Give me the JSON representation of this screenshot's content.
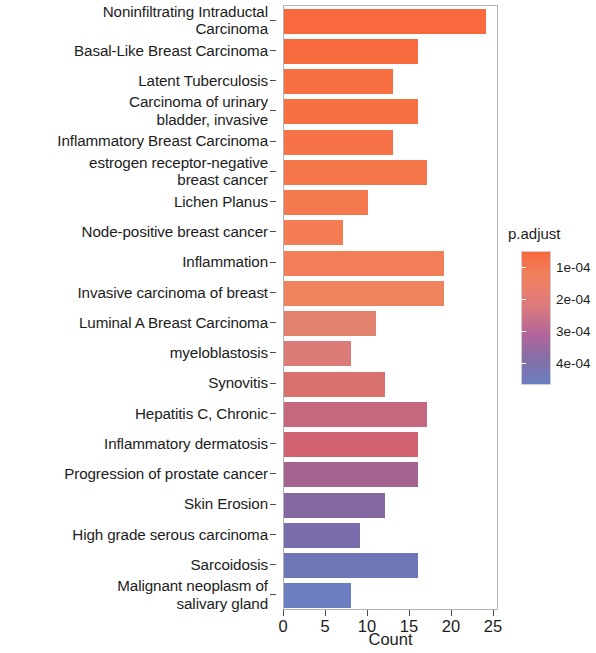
{
  "chart_data": {
    "type": "bar",
    "orientation": "horizontal",
    "title": "",
    "xlabel": "Count",
    "ylabel": "",
    "xlim": [
      0,
      25
    ],
    "xticks": [
      0,
      5,
      10,
      15,
      20,
      25
    ],
    "xtick_labels": [
      "0",
      "5",
      "10",
      "15",
      "20",
      "25"
    ],
    "grid": false,
    "legend": {
      "title": "p.adjust",
      "position": "right",
      "type": "continuous-colorbar",
      "ticks": [
        0.0001,
        0.0002,
        0.0003,
        0.0004
      ],
      "tick_labels": [
        "1e-04",
        "2e-04",
        "3e-04",
        "4e-04"
      ],
      "range": [
        5e-05,
        0.00047
      ],
      "low_color": "#F8693D",
      "high_color": "#6B7FC0"
    },
    "categories": [
      "Noninfiltrating Intraductal\nCarcinoma",
      "Basal-Like Breast Carcinoma",
      "Latent Tuberculosis",
      "Carcinoma of urinary\nbladder, invasive",
      "Inflammatory Breast Carcinoma",
      "estrogen receptor-negative\nbreast cancer",
      "Lichen Planus",
      "Node-positive breast cancer",
      "Inflammation",
      "Invasive carcinoma of breast",
      "Luminal A Breast Carcinoma",
      "myeloblastosis",
      "Synovitis",
      "Hepatitis C, Chronic",
      "Inflammatory dermatosis",
      "Progression of prostate cancer",
      "Skin Erosion",
      "High grade serous carcinoma",
      "Sarcoidosis",
      "Malignant neoplasm of\nsalivary gland"
    ],
    "values": [
      24,
      16,
      13,
      16,
      13,
      17,
      10,
      7,
      19,
      19,
      11,
      8,
      12,
      17,
      16,
      16,
      12,
      9,
      16,
      8
    ],
    "p_adjust": [
      5.5e-05,
      6e-05,
      6.5e-05,
      7e-05,
      8e-05,
      9e-05,
      0.0001,
      0.000105,
      0.000115,
      0.000125,
      0.00015,
      0.00017,
      0.00018,
      0.00023,
      0.00025,
      0.0003,
      0.00034,
      0.000375,
      0.0004,
      0.00044
    ],
    "bar_colors": [
      "#F8693D",
      "#F86B3E",
      "#F76E41",
      "#F77044",
      "#F77347",
      "#F6764B",
      "#F5794E",
      "#F47C52",
      "#F27F57",
      "#EF835D",
      "#E28370",
      "#DB7B77",
      "#D9726F",
      "#C5687F",
      "#D06272",
      "#A4638F",
      "#8467A1",
      "#7B6DAC",
      "#6E76B8",
      "#6B7FC0"
    ]
  }
}
